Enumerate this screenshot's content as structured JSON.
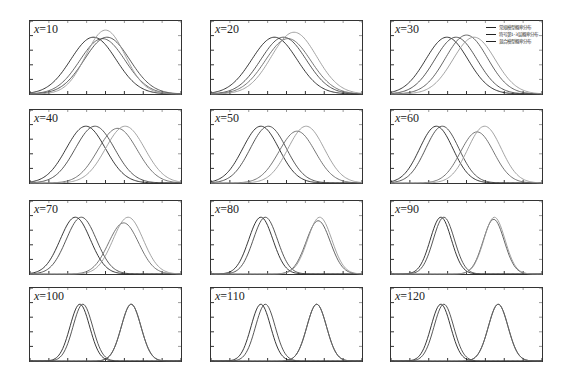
{
  "chart_data": {
    "type": "line",
    "title": "",
    "layout": "4x3 grid of small-multiple panels",
    "xlabel": "",
    "ylabel": "",
    "grid": false,
    "legend": {
      "panel": "x=30",
      "position": "upper right",
      "entries": [
        "常规模型概率分布",
        "符号第1-3层概率分布",
        "混合模型概率分布"
      ]
    },
    "curve_shape": "gaussian",
    "panels": [
      {
        "label_var": "x",
        "label_value": "10",
        "curves": [
          {
            "mu": 0.42,
            "sigma": 0.15,
            "h": 0.8,
            "color": "#222"
          },
          {
            "mu": 0.48,
            "sigma": 0.15,
            "h": 0.78,
            "color": "#555"
          },
          {
            "mu": 0.51,
            "sigma": 0.15,
            "h": 0.8,
            "color": "#444"
          },
          {
            "mu": 0.5,
            "sigma": 0.13,
            "h": 0.9,
            "color": "#999"
          }
        ]
      },
      {
        "label_var": "x",
        "label_value": "20",
        "curves": [
          {
            "mu": 0.42,
            "sigma": 0.15,
            "h": 0.8,
            "color": "#222"
          },
          {
            "mu": 0.48,
            "sigma": 0.15,
            "h": 0.8,
            "color": "#444"
          },
          {
            "mu": 0.51,
            "sigma": 0.15,
            "h": 0.78,
            "color": "#666"
          },
          {
            "mu": 0.55,
            "sigma": 0.15,
            "h": 0.87,
            "color": "#999"
          }
        ]
      },
      {
        "label_var": "x",
        "label_value": "30",
        "curves": [
          {
            "mu": 0.37,
            "sigma": 0.14,
            "h": 0.8,
            "color": "#222"
          },
          {
            "mu": 0.43,
            "sigma": 0.14,
            "h": 0.8,
            "color": "#444"
          },
          {
            "mu": 0.5,
            "sigma": 0.14,
            "h": 0.83,
            "color": "#555"
          },
          {
            "mu": 0.55,
            "sigma": 0.14,
            "h": 0.8,
            "color": "#999"
          }
        ]
      },
      {
        "label_var": "x",
        "label_value": "40",
        "curves": [
          {
            "mu": 0.37,
            "sigma": 0.13,
            "h": 0.8,
            "color": "#222"
          },
          {
            "mu": 0.43,
            "sigma": 0.13,
            "h": 0.8,
            "color": "#444"
          },
          {
            "mu": 0.58,
            "sigma": 0.13,
            "h": 0.77,
            "color": "#666"
          },
          {
            "mu": 0.63,
            "sigma": 0.13,
            "h": 0.8,
            "color": "#999"
          }
        ]
      },
      {
        "label_var": "x",
        "label_value": "50",
        "curves": [
          {
            "mu": 0.33,
            "sigma": 0.12,
            "h": 0.8,
            "color": "#222"
          },
          {
            "mu": 0.38,
            "sigma": 0.12,
            "h": 0.8,
            "color": "#444"
          },
          {
            "mu": 0.57,
            "sigma": 0.12,
            "h": 0.73,
            "color": "#666"
          },
          {
            "mu": 0.63,
            "sigma": 0.12,
            "h": 0.8,
            "color": "#999"
          }
        ]
      },
      {
        "label_var": "x",
        "label_value": "60",
        "curves": [
          {
            "mu": 0.3,
            "sigma": 0.11,
            "h": 0.8,
            "color": "#222"
          },
          {
            "mu": 0.34,
            "sigma": 0.11,
            "h": 0.8,
            "color": "#444"
          },
          {
            "mu": 0.57,
            "sigma": 0.11,
            "h": 0.72,
            "color": "#666"
          },
          {
            "mu": 0.62,
            "sigma": 0.11,
            "h": 0.8,
            "color": "#999"
          }
        ]
      },
      {
        "label_var": "x",
        "label_value": "70",
        "curves": [
          {
            "mu": 0.3,
            "sigma": 0.1,
            "h": 0.8,
            "color": "#222"
          },
          {
            "mu": 0.34,
            "sigma": 0.1,
            "h": 0.8,
            "color": "#444"
          },
          {
            "mu": 0.62,
            "sigma": 0.1,
            "h": 0.72,
            "color": "#666"
          },
          {
            "mu": 0.65,
            "sigma": 0.1,
            "h": 0.8,
            "color": "#999"
          }
        ]
      },
      {
        "label_var": "x",
        "label_value": "80",
        "curves": [
          {
            "mu": 0.33,
            "sigma": 0.08,
            "h": 0.8,
            "color": "#222"
          },
          {
            "mu": 0.36,
            "sigma": 0.08,
            "h": 0.8,
            "color": "#444"
          },
          {
            "mu": 0.71,
            "sigma": 0.08,
            "h": 0.75,
            "color": "#555"
          },
          {
            "mu": 0.72,
            "sigma": 0.08,
            "h": 0.8,
            "color": "#999"
          }
        ]
      },
      {
        "label_var": "x",
        "label_value": "90",
        "curves": [
          {
            "mu": 0.33,
            "sigma": 0.07,
            "h": 0.8,
            "color": "#222"
          },
          {
            "mu": 0.35,
            "sigma": 0.07,
            "h": 0.8,
            "color": "#444"
          },
          {
            "mu": 0.68,
            "sigma": 0.07,
            "h": 0.77,
            "color": "#555"
          },
          {
            "mu": 0.685,
            "sigma": 0.07,
            "h": 0.8,
            "color": "#999"
          }
        ]
      },
      {
        "label_var": "x",
        "label_value": "100",
        "curves": [
          {
            "mu": 0.33,
            "sigma": 0.065,
            "h": 0.8,
            "color": "#222"
          },
          {
            "mu": 0.35,
            "sigma": 0.065,
            "h": 0.8,
            "color": "#444"
          },
          {
            "mu": 0.67,
            "sigma": 0.065,
            "h": 0.8,
            "color": "#333"
          },
          {
            "mu": 0.67,
            "sigma": 0.065,
            "h": 0.8,
            "color": "#666"
          }
        ]
      },
      {
        "label_var": "x",
        "label_value": "110",
        "curves": [
          {
            "mu": 0.33,
            "sigma": 0.065,
            "h": 0.8,
            "color": "#222"
          },
          {
            "mu": 0.36,
            "sigma": 0.065,
            "h": 0.8,
            "color": "#444"
          },
          {
            "mu": 0.7,
            "sigma": 0.065,
            "h": 0.8,
            "color": "#333"
          },
          {
            "mu": 0.7,
            "sigma": 0.065,
            "h": 0.8,
            "color": "#666"
          }
        ]
      },
      {
        "label_var": "x",
        "label_value": "120",
        "curves": [
          {
            "mu": 0.33,
            "sigma": 0.065,
            "h": 0.8,
            "color": "#222"
          },
          {
            "mu": 0.35,
            "sigma": 0.065,
            "h": 0.8,
            "color": "#444"
          },
          {
            "mu": 0.71,
            "sigma": 0.065,
            "h": 0.8,
            "color": "#333"
          },
          {
            "mu": 0.71,
            "sigma": 0.065,
            "h": 0.8,
            "color": "#666"
          }
        ]
      }
    ]
  },
  "layout_grid": {
    "cols": [
      29,
      210,
      390
    ],
    "rows": [
      20,
      109,
      200,
      287
    ],
    "panel_w": 153,
    "panel_h": 75,
    "x_ticks": 8,
    "y_ticks": 5
  }
}
